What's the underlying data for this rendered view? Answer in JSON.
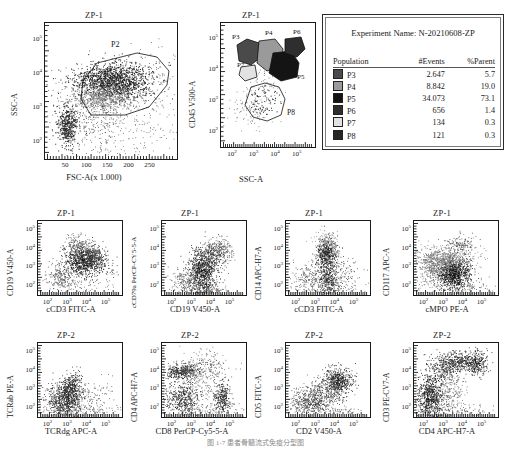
{
  "figure": {
    "caption": "图 1-7    患者骨髓流式免疫分型图"
  },
  "legend_card": {
    "experiment_label": "Experiment Name: N-20210608-ZP",
    "columns": [
      "Population",
      "#Events",
      "%Parent"
    ],
    "rows": [
      {
        "swatch": "#4a4a4a",
        "population": "P3",
        "events": "2.647",
        "parent": "5.7"
      },
      {
        "swatch": "#9a9a9a",
        "population": "P4",
        "events": "8.842",
        "parent": "19.0"
      },
      {
        "swatch": "#141414",
        "population": "P5",
        "events": "34.073",
        "parent": "73.1"
      },
      {
        "swatch": "#2e2e2e",
        "population": "P6",
        "events": "656",
        "parent": "1.4"
      },
      {
        "swatch": "#e2e2e2",
        "population": "P7",
        "events": "134",
        "parent": "0.3"
      },
      {
        "swatch": "#262626",
        "population": "P8",
        "events": "121",
        "parent": "0.3"
      }
    ]
  },
  "chart_data": [
    {
      "id": "scatter-fsc-ssc",
      "type": "scatter",
      "title": "ZP-1",
      "xlabel": "FSC-A(x 1.000)",
      "ylabel": "SSC-A",
      "xscale": "linear",
      "xticks": [
        "50",
        "100",
        "150",
        "200",
        "250"
      ],
      "yticks": [
        "10<sup>5</sup>",
        "10<sup>4</sup>",
        "10<sup>3</sup>",
        "10<sup>2</sup>"
      ],
      "ylim": [
        "10^2",
        "10^5"
      ],
      "xlim": [
        0,
        262
      ],
      "gates": [
        {
          "label": "P2"
        }
      ]
    },
    {
      "id": "scatter-ssc-cd45",
      "type": "scatter",
      "title": "ZP-1",
      "xlabel": "SSC-A",
      "ylabel": "CD45 V500-A",
      "xscale": "log",
      "xticks": [
        "10<sup>2</sup>",
        "10<sup>3</sup>",
        "10<sup>4</sup>",
        "10<sup>5</sup>"
      ],
      "yticks": [
        "10<sup>5</sup>",
        "10<sup>4</sup>",
        "10<sup>3</sup>",
        "10<sup>2</sup>"
      ],
      "gates": [
        {
          "label": "P3"
        },
        {
          "label": "P4"
        },
        {
          "label": "P6"
        },
        {
          "label": "P7"
        },
        {
          "label": "P5"
        },
        {
          "label": "P8"
        }
      ]
    },
    {
      "id": "scatter-ccd3-cd19",
      "type": "scatter",
      "title": "ZP-1",
      "xlabel": "cCD3 FITC-A",
      "ylabel": "CD19 V450-A",
      "xscale": "log",
      "xticks": [
        "10<sup>2</sup>",
        "10<sup>3</sup>",
        "10<sup>4</sup>",
        "10<sup>5</sup>"
      ],
      "yticks": [
        "10<sup>5</sup>",
        "10<sup>4</sup>",
        "10<sup>3</sup>",
        "10<sup>2</sup>"
      ]
    },
    {
      "id": "scatter-cd19-ccd79a",
      "type": "scatter",
      "title": "ZP-1",
      "xlabel": "CD19 V450-A",
      "ylabel": "cCD79a PerCP-CY5-5-A",
      "xscale": "log",
      "xticks": [
        "10<sup>2</sup>",
        "10<sup>3</sup>",
        "10<sup>4</sup>",
        "10<sup>5</sup>"
      ],
      "yticks": [
        "10<sup>5</sup>",
        "10<sup>4</sup>",
        "10<sup>3</sup>",
        "10<sup>2</sup>"
      ]
    },
    {
      "id": "scatter-ccd3-cd14",
      "type": "scatter",
      "title": "ZP-1",
      "xlabel": "cCD3 FITC-A",
      "ylabel": "CD14 APC-H7-A",
      "xscale": "log",
      "xticks": [
        "10<sup>2</sup>",
        "10<sup>3</sup>",
        "10<sup>4</sup>",
        "10<sup>5</sup>"
      ],
      "yticks": [
        "10<sup>5</sup>",
        "10<sup>4</sup>",
        "10<sup>3</sup>",
        "10<sup>2</sup>"
      ]
    },
    {
      "id": "scatter-cmpo-cd117",
      "type": "scatter",
      "title": "ZP-1",
      "xlabel": "cMPO PE-A",
      "ylabel": "CD117 APC-A",
      "xscale": "log",
      "xticks": [
        "10<sup>2</sup>",
        "10<sup>3</sup>",
        "10<sup>4</sup>",
        "10<sup>5</sup>"
      ],
      "yticks": [
        "10<sup>5</sup>",
        "10<sup>4</sup>",
        "10<sup>3</sup>",
        "10<sup>2</sup>"
      ]
    },
    {
      "id": "scatter-tcrdg-tcrab",
      "type": "scatter",
      "title": "ZP-2",
      "xlabel": "TCRdg APC-A",
      "ylabel": "TCRab PE-A",
      "xscale": "log",
      "xticks": [
        "10<sup>2</sup>",
        "10<sup>3</sup>",
        "10<sup>4</sup>",
        "10<sup>5</sup>"
      ],
      "yticks": [
        "10<sup>5</sup>",
        "10<sup>4</sup>",
        "10<sup>3</sup>",
        "10<sup>2</sup>"
      ]
    },
    {
      "id": "scatter-cd8-cd4",
      "type": "scatter",
      "title": "ZP-2",
      "xlabel": "CD8 PerCP-Cy5-5-A",
      "ylabel": "CD4 APC-H7-A",
      "xscale": "log",
      "xticks": [
        "10<sup>2</sup>",
        "10<sup>3</sup>",
        "10<sup>4</sup>",
        "10<sup>5</sup>"
      ],
      "yticks": [
        "10<sup>5</sup>",
        "10<sup>4</sup>",
        "10<sup>3</sup>",
        "10<sup>2</sup>"
      ]
    },
    {
      "id": "scatter-cd2-cd5",
      "type": "scatter",
      "title": "ZP-2",
      "xlabel": "CD2 V450-A",
      "ylabel": "CD5 FITC-A",
      "xscale": "log",
      "xticks": [
        "10<sup>2</sup>",
        "10<sup>3</sup>",
        "10<sup>4</sup>",
        "10<sup>5</sup>"
      ],
      "yticks": [
        "10<sup>5</sup>",
        "10<sup>4</sup>",
        "10<sup>3</sup>",
        "10<sup>2</sup>"
      ]
    },
    {
      "id": "scatter-cd4-cd3",
      "type": "scatter",
      "title": "ZP-2",
      "xlabel": "CD4 APC-H7-A",
      "ylabel": "CD3 PE-CV7-A",
      "xscale": "log",
      "xticks": [
        "10<sup>2</sup>",
        "10<sup>3</sup>",
        "10<sup>4</sup>",
        "10<sup>5</sup>"
      ],
      "yticks": [
        "10<sup>5</sup>",
        "10<sup>4</sup>",
        "10<sup>3</sup>",
        "10<sup>2</sup>"
      ]
    }
  ]
}
